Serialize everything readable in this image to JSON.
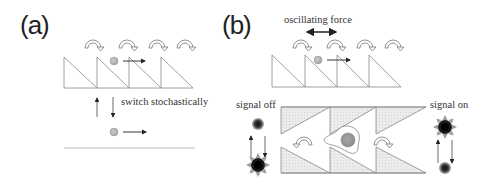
{
  "panel_a": {
    "label": "(a)",
    "switch_text": "switch stochastically"
  },
  "panel_b": {
    "label": "(b)",
    "force_text": "oscillating force",
    "signal_off_text": "signal off",
    "signal_on_text": "signal on"
  },
  "colors": {
    "line": "#777777",
    "ball": "#b9b9b9",
    "ball_dark": "#9a9a9a",
    "shade": "#e4e4e4",
    "star": "#1a1a1a",
    "star_ray": "#9c9c9c"
  }
}
